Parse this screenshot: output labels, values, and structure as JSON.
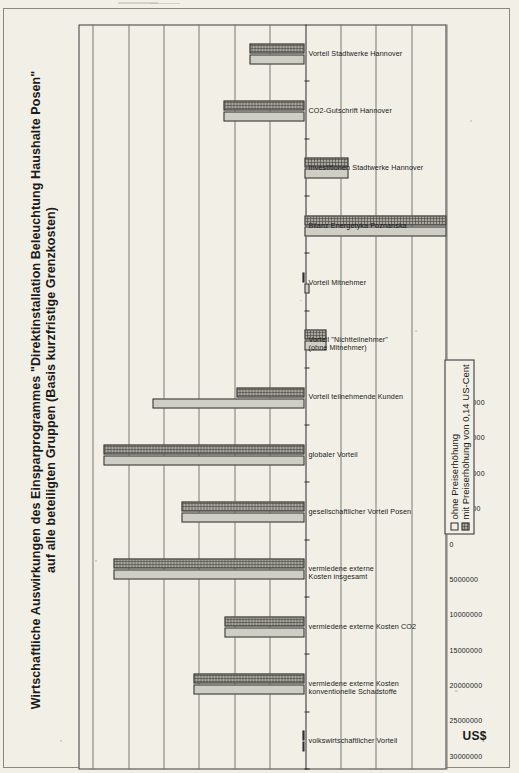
{
  "chart_data": {
    "type": "bar",
    "title": "Wirtschaftliche Auswirkungen des Einsparprogrammes \"Direktinstallation Beleuchtung Haushalte Posen\" auf alle beteiligten Gruppen (Basis kurzfristige Grenzkosten)",
    "xlabel": "",
    "ylabel": "US$",
    "ylim": [
      -20000000,
      32000000
    ],
    "grid": true,
    "legend_position": "bottom-right",
    "orientation": "vertical-bars-rotated-page",
    "ytick_labels": [
      "-20000000",
      "-15000000",
      "-10000000",
      "-5000000",
      "0",
      "5000000",
      "10000000",
      "15000000",
      "20000000",
      "25000000",
      "30000000"
    ],
    "ytick_values": [
      -20000000,
      -15000000,
      -10000000,
      -5000000,
      0,
      5000000,
      10000000,
      15000000,
      20000000,
      25000000,
      30000000
    ],
    "categories": [
      "volkswirtschaftlicher Vorteil",
      "vermiedene externe Kosten konventionelle Schadstoffe",
      "vermiedene externe Kosten CO2",
      "vermiedene externe Kosten insgesamt",
      "gesellschaftlicher Vorteil Posen",
      "globaler Vorteil",
      "Vorteil teilnehmende Kunden",
      "Vorteil \"Nichtteilnehmer\" (ohne Mitnehmer)",
      "Vorteil Mitnehmer",
      "Bilanz Energetyka Poznanska",
      "Investitionen Stadtwerke Hannover",
      "CO2-Gutschrift Hannover",
      "Vorteil Stadtwerke Hannover"
    ],
    "series": [
      {
        "name": "ohne Preiserhöhung",
        "values": [
          400000,
          15700000,
          11400000,
          27100000,
          17400000,
          28500000,
          21500000,
          -3000000,
          -700000,
          -20000000,
          -6200000,
          11500000,
          7800000
        ]
      },
      {
        "name": "mit Preiserhöhung von 0,14 US-Cent",
        "values": [
          400000,
          15700000,
          11400000,
          27100000,
          17400000,
          28500000,
          9700000,
          -3000000,
          300000,
          -20000000,
          -6200000,
          11500000,
          7800000
        ]
      }
    ]
  },
  "legend": {
    "items": [
      {
        "label": "ohne Preiserhöhung",
        "style": "empty"
      },
      {
        "label": "mit Preiserhöhung von 0,14 US-Cent",
        "style": "hatched"
      }
    ]
  },
  "colors": {
    "paper": "#f1efe6",
    "series_0": "#cfcec4",
    "series_1": "#a9a79c",
    "axis": "#2b2b2b",
    "grid": "#7b7b72"
  }
}
